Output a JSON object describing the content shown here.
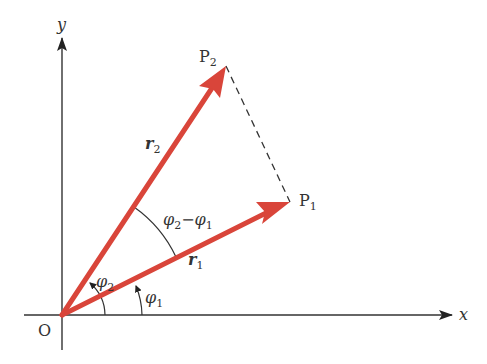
{
  "diagram": {
    "colors": {
      "vector": "#d9453a",
      "axis": "#333333",
      "dashed": "#333333",
      "background": "#ffffff"
    },
    "axes": {
      "x_label": "x",
      "y_label": "y",
      "origin_label": "O"
    },
    "points": {
      "p1": {
        "label": "P",
        "sub": "1"
      },
      "p2": {
        "label": "P",
        "sub": "2"
      }
    },
    "vectors": {
      "r1": {
        "label": "r",
        "sub": "1"
      },
      "r2": {
        "label": "r",
        "sub": "2"
      }
    },
    "angles": {
      "phi1": {
        "label": "φ",
        "sub": "1"
      },
      "phi2": {
        "label": "φ",
        "sub": "2"
      },
      "diff": {
        "a": "φ",
        "a_sub": "2",
        "minus": "−",
        "b": "φ",
        "b_sub": "1"
      }
    }
  }
}
